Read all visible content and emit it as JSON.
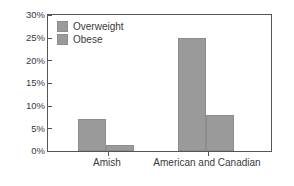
{
  "chart_data": {
    "type": "bar",
    "title": "",
    "subtitle": "",
    "xlabel": "",
    "ylabel": "",
    "categories": [
      "Amish",
      "American and Canadian"
    ],
    "series": [
      {
        "name": "Overweight",
        "values": [
          7,
          25
        ],
        "color": "#9a9a9a"
      },
      {
        "name": "Obese",
        "values": [
          1.3,
          8
        ],
        "color": "#9a9a9a"
      }
    ],
    "ylim": [
      0,
      30
    ],
    "ytick_values": [
      0,
      5,
      10,
      15,
      20,
      25,
      30
    ],
    "ytick_labels": [
      "0%",
      "5%",
      "10%",
      "15%",
      "20%",
      "25%",
      "30%"
    ],
    "xtick_labels": [
      "Amish",
      "American and Canadian"
    ],
    "grid": false,
    "legend_position": "upper-left-inside",
    "legend_entries": [
      "Overweight",
      "Obese"
    ],
    "axis_color": "#555555",
    "text_color": "#3a3a3a",
    "background": "#ffffff",
    "value_suffix": "%"
  }
}
